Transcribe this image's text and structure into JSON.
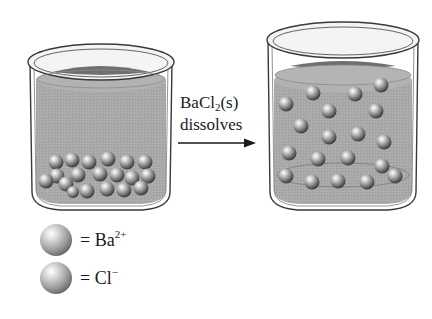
{
  "arrow_label": {
    "line1_prefix": "BaCl",
    "line1_sub": "2",
    "line1_suffix": "(s)",
    "line2": "dissolves"
  },
  "beakers": [
    {
      "name": "before",
      "state": "solid settled at bottom",
      "particle_count": 19
    },
    {
      "name": "after",
      "state": "ions dispersed in solution",
      "particle_count": 19
    }
  ],
  "legend": [
    {
      "symbol": "Ba",
      "charge": "2+",
      "prefix": "= "
    },
    {
      "symbol": "Cl",
      "charge": "−",
      "prefix": "= "
    }
  ],
  "colors": {
    "liquid": "#a8a8a8",
    "liquid_surface": "#6f6f6f",
    "glass_outline": "#3a3a3a",
    "background": "#ffffff"
  }
}
